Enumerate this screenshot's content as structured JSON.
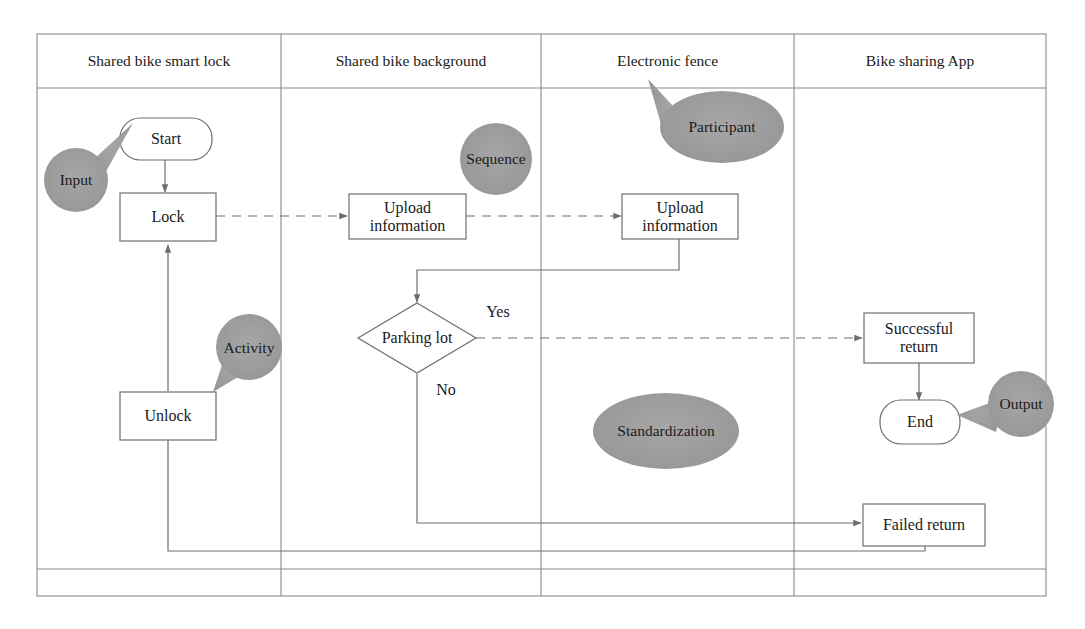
{
  "diagram": {
    "type": "cross-functional-flowchart",
    "colors": {
      "stroke": "#6e6e6e",
      "frame": "#8a8a8a",
      "annotation_fill": "#9c9c9c",
      "text": "#1a1a1a",
      "background": "#ffffff"
    },
    "lanes": [
      {
        "id": "lane-smart-lock",
        "label": "Shared bike smart lock"
      },
      {
        "id": "lane-background",
        "label": "Shared bike background"
      },
      {
        "id": "lane-fence",
        "label": "Electronic fence"
      },
      {
        "id": "lane-app",
        "label": "Bike sharing App"
      }
    ],
    "nodes": [
      {
        "id": "start",
        "label": "Start",
        "shape": "rounded-terminator",
        "lane": "lane-smart-lock"
      },
      {
        "id": "lock",
        "label": "Lock",
        "shape": "rectangle",
        "lane": "lane-smart-lock"
      },
      {
        "id": "unlock",
        "label": "Unlock",
        "shape": "rectangle",
        "lane": "lane-smart-lock"
      },
      {
        "id": "upload-info-background",
        "label": "Upload\ninformation",
        "shape": "rectangle",
        "lane": "lane-background"
      },
      {
        "id": "upload-info-fence",
        "label": "Upload\ninformation",
        "shape": "rectangle",
        "lane": "lane-fence"
      },
      {
        "id": "parking-lot",
        "label": "Parking lot",
        "shape": "diamond",
        "lane": "lane-background"
      },
      {
        "id": "successful-return",
        "label": "Successful\nreturn",
        "shape": "rectangle",
        "lane": "lane-app"
      },
      {
        "id": "end",
        "label": "End",
        "shape": "rounded-terminator",
        "lane": "lane-app"
      },
      {
        "id": "failed-return",
        "label": "Failed return",
        "shape": "rectangle",
        "lane": "lane-app"
      }
    ],
    "edge_labels": [
      {
        "id": "yes-label",
        "label": "Yes"
      },
      {
        "id": "no-label",
        "label": "No"
      }
    ],
    "annotations": [
      {
        "id": "annot-input",
        "label": "Input",
        "shape": "callout-circle",
        "points_to": "start"
      },
      {
        "id": "annot-activity",
        "label": "Activity",
        "shape": "callout-circle",
        "points_to": "unlock"
      },
      {
        "id": "annot-sequence",
        "label": "Sequence",
        "shape": "circle",
        "points_to": null
      },
      {
        "id": "annot-participant",
        "label": "Participant",
        "shape": "callout-ellipse",
        "points_to": "lane-fence"
      },
      {
        "id": "annot-standardization",
        "label": "Standardization",
        "shape": "ellipse",
        "points_to": null
      },
      {
        "id": "annot-output",
        "label": "Output",
        "shape": "callout-circle",
        "points_to": "end"
      }
    ],
    "edges": [
      {
        "from": "start",
        "to": "lock",
        "style": "solid"
      },
      {
        "from": "lock",
        "to": "upload-info-background",
        "style": "dashed"
      },
      {
        "from": "upload-info-background",
        "to": "upload-info-fence",
        "style": "dashed"
      },
      {
        "from": "upload-info-fence",
        "to": "parking-lot",
        "style": "solid"
      },
      {
        "from": "parking-lot",
        "to": "successful-return",
        "style": "dashed",
        "label": "Yes"
      },
      {
        "from": "parking-lot",
        "to": "failed-return",
        "style": "solid",
        "label": "No"
      },
      {
        "from": "successful-return",
        "to": "end",
        "style": "solid"
      },
      {
        "from": "failed-return",
        "to": "unlock",
        "style": "solid"
      },
      {
        "from": "unlock",
        "to": "lock",
        "style": "solid"
      }
    ]
  }
}
